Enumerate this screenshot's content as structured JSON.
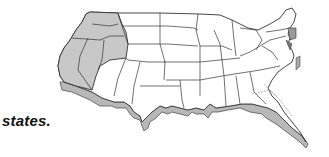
{
  "caption": "states.",
  "map": {
    "title": "United States map",
    "highlighted_region": "western-states",
    "highlight_color": "#c8c8c8",
    "land_color": "#ffffff",
    "border_color": "#333333",
    "extrusion_color": "#b4b4b4"
  }
}
